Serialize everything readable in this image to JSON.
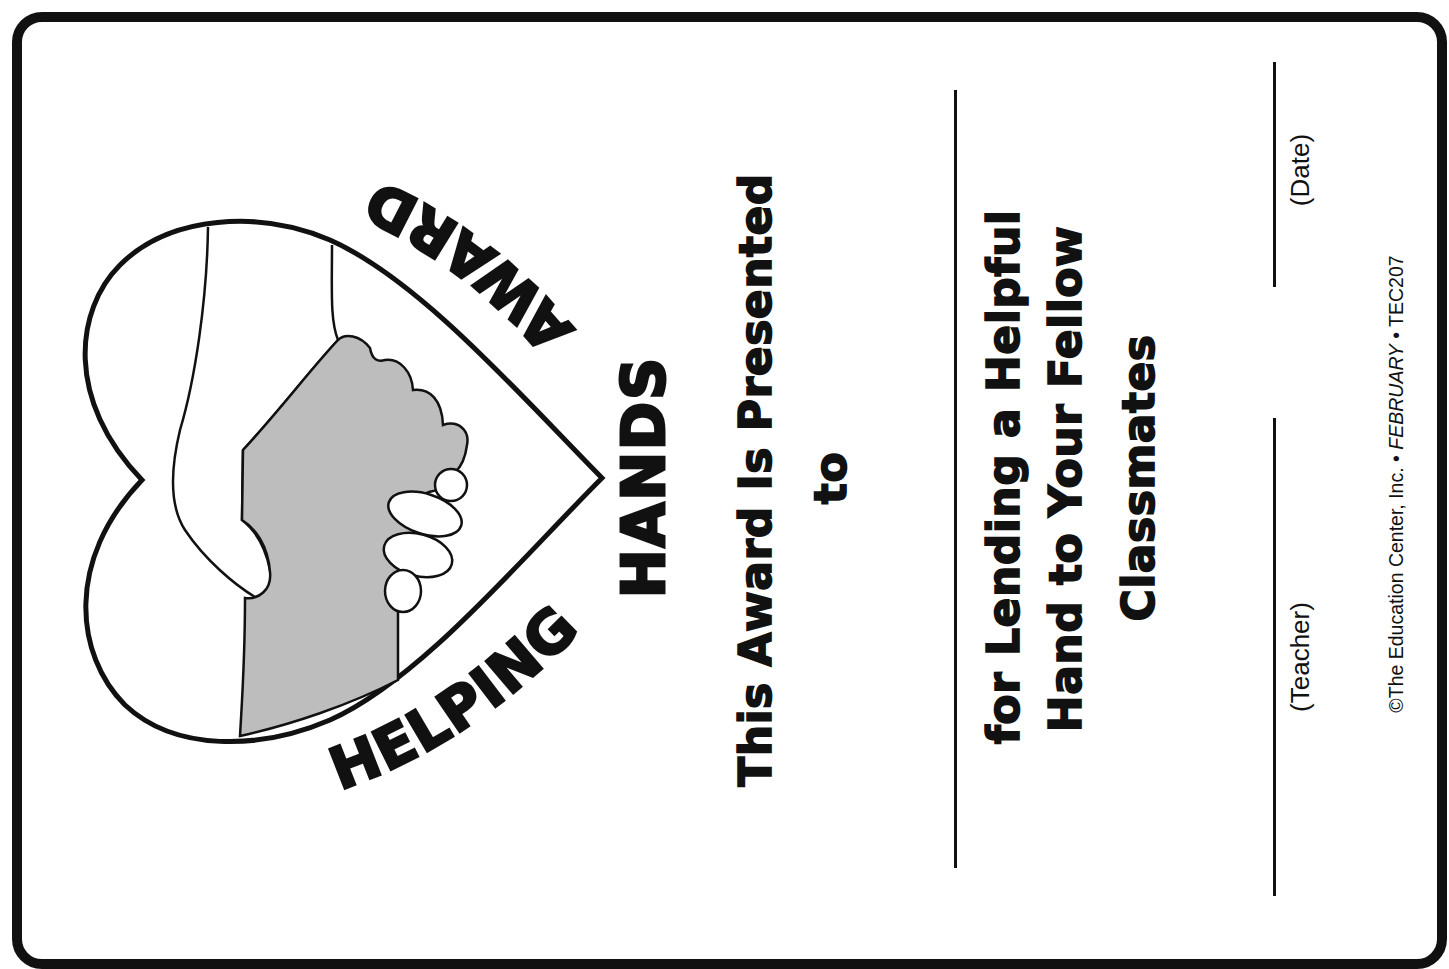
{
  "certificate": {
    "title_words": {
      "helping": "HELPING",
      "hands": "HANDS",
      "award": "AWARD"
    },
    "presented_line": "This Award Is Presented",
    "presented_to": "to",
    "reason_lines": [
      "for Lending a Helpful",
      "Hand to Your Fellow",
      "Classmates"
    ],
    "signature_labels": {
      "date": "(Date)",
      "teacher": "(Teacher)"
    },
    "copyright": {
      "prefix": "©The Education Center, Inc. • ",
      "month": "FEBRUARY",
      "suffix": " • TEC207"
    },
    "illustration": {
      "name": "heart-with-clasped-hands",
      "colors": {
        "outline": "#111111",
        "gray_hand": "#bdbdbd",
        "white_hand": "#ffffff"
      }
    },
    "colors": {
      "ink": "#111111",
      "paper": "#ffffff"
    }
  }
}
